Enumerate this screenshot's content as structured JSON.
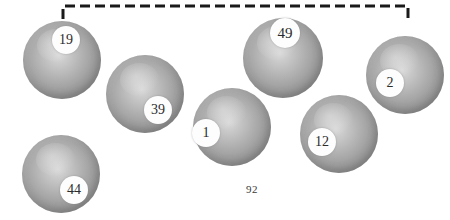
{
  "figure": {
    "background_color": "#ffffff",
    "page_number": "92",
    "page_number_position": {
      "x": 246,
      "y": 183
    },
    "bracket": {
      "name": "dashed-bracket",
      "color": "#1a1a1a",
      "stroke_width": 3,
      "dash_length": 10,
      "gap_length": 5,
      "x_start": 63,
      "x_end": 408,
      "y_line": 6,
      "tick_height": 13
    },
    "sphere_style": {
      "fill_light": "#d8d8d8",
      "fill_mid": "#a8a8a8",
      "fill_edge": "#8a8a8a",
      "badge_fill": "#fdfdfd",
      "badge_text_color": "#2b2b2b"
    },
    "spheres": [
      {
        "id": "sphere-19",
        "label": "19",
        "cx": 62,
        "cy": 60,
        "r": 39,
        "badge_cx": 66,
        "badge_cy": 40,
        "badge_r": 14,
        "font_size": 14
      },
      {
        "id": "sphere-39",
        "label": "39",
        "cx": 145,
        "cy": 94,
        "r": 39,
        "badge_cx": 158,
        "badge_cy": 110,
        "badge_r": 14,
        "font_size": 14
      },
      {
        "id": "sphere-44",
        "label": "44",
        "cx": 61,
        "cy": 174,
        "r": 39,
        "badge_cx": 74,
        "badge_cy": 190,
        "badge_r": 14,
        "font_size": 14
      },
      {
        "id": "sphere-1",
        "label": "1",
        "cx": 232,
        "cy": 127,
        "r": 39,
        "badge_cx": 206,
        "badge_cy": 133,
        "badge_r": 14,
        "font_size": 14
      },
      {
        "id": "sphere-49",
        "label": "49",
        "cx": 283,
        "cy": 58,
        "r": 40,
        "badge_cx": 285,
        "badge_cy": 33,
        "badge_r": 15,
        "font_size": 15
      },
      {
        "id": "sphere-12",
        "label": "12",
        "cx": 339,
        "cy": 134,
        "r": 39,
        "badge_cx": 322,
        "badge_cy": 142,
        "badge_r": 14,
        "font_size": 14
      },
      {
        "id": "sphere-2",
        "label": "2",
        "cx": 405,
        "cy": 75,
        "r": 39,
        "badge_cx": 390,
        "badge_cy": 83,
        "badge_r": 14,
        "font_size": 14
      }
    ]
  }
}
